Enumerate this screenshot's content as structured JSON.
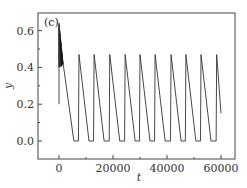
{
  "chart_data": {
    "type": "line",
    "title": "",
    "panel_label": "(c)",
    "xlabel": "t",
    "ylabel": "y",
    "xlim": [
      -8000,
      65000
    ],
    "ylim": [
      -0.1,
      0.7
    ],
    "xticks": [
      0,
      20000,
      40000,
      60000
    ],
    "xtick_labels": [
      "0",
      "20000",
      "40000",
      "60000"
    ],
    "yticks": [
      0.0,
      0.2,
      0.4,
      0.6
    ],
    "ytick_labels": [
      "0.0",
      "0.2",
      "0.4",
      "0.6"
    ],
    "grid": false,
    "legend": null,
    "series": [
      {
        "name": "y(t)",
        "color": "#333333",
        "description": "Initial dense oscillation burst (t≈0–1500, y≈0.40–0.64), then relaxation oscillations: sharp rise to ~0.47, linear decay to 0, plateau at 0, repeating with period ≈5700.",
        "initial_burst": {
          "t_start": 0,
          "t_end": 1500,
          "y_min": 0.4,
          "y_max": 0.64,
          "y_start": 0.2
        },
        "peaks_t": [
          7400,
          13000,
          18800,
          24500,
          30000,
          35600,
          41500,
          47000,
          52600,
          58400
        ],
        "peak_y": 0.47,
        "trough_y": 0.0,
        "end_point": {
          "t": 60000,
          "y": 0.15
        }
      }
    ]
  }
}
